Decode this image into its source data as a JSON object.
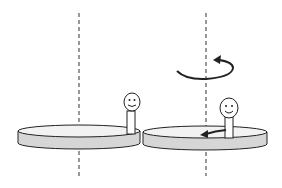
{
  "diagram": {
    "colors": {
      "background": "#ffffff",
      "stroke": "#222222",
      "disk_fill": "#f2f2f2",
      "disk_side_fill": "#d6d6d6",
      "axis": "#333333"
    },
    "panels": [
      {
        "id": "left",
        "axis_x": 79,
        "disk": {
          "cx": 79,
          "cy": 131,
          "rx": 61,
          "ry": 6,
          "thickness": 12
        },
        "figure": {
          "x": 131,
          "head_cy": 102,
          "head_r": 9
        },
        "rotation_arrow": false,
        "motion_arrow": false
      },
      {
        "id": "right",
        "axis_x": 206,
        "disk": {
          "cx": 205,
          "cy": 132,
          "rx": 62,
          "ry": 6,
          "thickness": 12
        },
        "figure": {
          "x": 229,
          "head_cy": 108,
          "head_r": 9
        },
        "rotation_arrow": true,
        "motion_arrow": true
      }
    ]
  }
}
